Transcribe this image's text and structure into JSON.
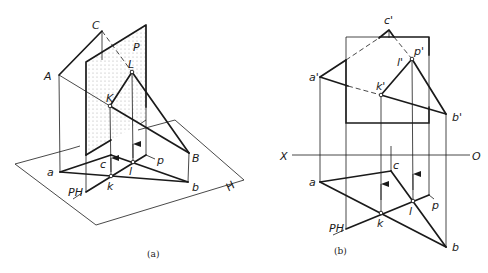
{
  "figure": {
    "colors": {
      "ink": "#1a1a1a",
      "background": "#ffffff",
      "plane_dots": "#9a9a9a"
    },
    "panel_a": {
      "caption": "(a)",
      "labels": {
        "C": "C",
        "A": "A",
        "P": "P",
        "L": "L",
        "K": "K",
        "B": "B",
        "a": "a",
        "b": "b",
        "c": "c",
        "k": "k",
        "l": "l",
        "p": "p",
        "PH": "PH",
        "H": "H"
      },
      "points": {
        "C": [
          102,
          31
        ],
        "A": [
          59,
          75
        ],
        "B": [
          189,
          153
        ],
        "a": [
          60,
          172
        ],
        "b": [
          188,
          182
        ],
        "c": [
          111,
          155
        ],
        "K": [
          110,
          106
        ],
        "L": [
          132,
          72
        ],
        "k": [
          111,
          176
        ],
        "l": [
          133,
          162
        ]
      },
      "plane_P": [
        [
          86,
          62
        ],
        [
          146,
          25
        ],
        [
          146,
          120
        ],
        [
          86,
          155
        ]
      ],
      "plane_H": [
        [
          15,
          164
        ],
        [
          175,
          120
        ],
        [
          244,
          180
        ],
        [
          96,
          225
        ]
      ]
    },
    "panel_b": {
      "caption": "(b)",
      "labels": {
        "c_prime": "c'",
        "a_prime": "a'",
        "b_prime": "b'",
        "k_prime": "k'",
        "l_prime": "l'",
        "p_prime": "p'",
        "X": "X",
        "O": "O",
        "a": "a",
        "b": "b",
        "c": "c",
        "k": "k",
        "l": "l",
        "p": "p",
        "PH": "PH"
      },
      "points": {
        "c_prime": [
          389,
          30
        ],
        "a_prime": [
          320,
          77
        ],
        "b_prime": [
          446,
          114
        ],
        "k_prime": [
          381,
          95
        ],
        "l_prime": [
          412,
          59
        ],
        "a": [
          320,
          182
        ],
        "b": [
          446,
          247
        ],
        "c": [
          391,
          171
        ],
        "k": [
          381,
          213
        ],
        "l": [
          413,
          201
        ]
      },
      "square_P": [
        [
          346,
          37
        ],
        [
          429,
          37
        ],
        [
          429,
          123
        ],
        [
          346,
          123
        ]
      ],
      "x_axis": {
        "y": 155,
        "x1": 292,
        "x2": 470
      }
    }
  }
}
